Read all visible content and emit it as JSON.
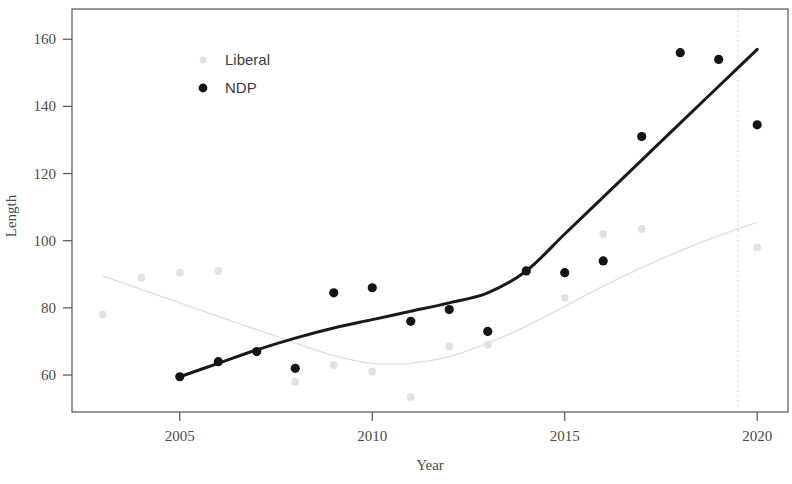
{
  "chart_data": {
    "type": "scatter",
    "title": "",
    "xlabel": "Year",
    "ylabel": "Length",
    "xlim": [
      2002.2,
      2020.8
    ],
    "ylim": [
      49,
      169
    ],
    "xticks": [
      2005,
      2010,
      2015,
      2020
    ],
    "xtick_labels": [
      "2005",
      "2010",
      "2015",
      "2020"
    ],
    "yticks": [
      60,
      80,
      100,
      120,
      140,
      160
    ],
    "ytick_labels": [
      "60",
      "80",
      "100",
      "120",
      "140",
      "160"
    ],
    "grid": false,
    "legend_position": "top-left-inside",
    "series": [
      {
        "name": "Liberal",
        "color": "#d9d9d9",
        "marker": "circle",
        "has_trend_line": true,
        "trend_line_style": "smooth-loess",
        "x": [
          2003,
          2004,
          2005,
          2006,
          2008,
          2009,
          2010,
          2011,
          2012,
          2013,
          2015,
          2016,
          2017,
          2020
        ],
        "y": [
          78,
          89,
          90.5,
          91,
          58,
          63,
          61,
          53.5,
          68.5,
          69,
          83,
          102,
          103.5,
          98
        ],
        "trend_x": [
          2003,
          2004,
          2005,
          2006,
          2007,
          2008,
          2009,
          2010,
          2011,
          2012,
          2013,
          2014,
          2015,
          2016,
          2017,
          2018,
          2019,
          2020
        ],
        "trend_y": [
          89.5,
          85.5,
          81.5,
          77.5,
          73.5,
          69.5,
          65.8,
          63.5,
          63.5,
          65.5,
          69.5,
          74.5,
          80.5,
          86.5,
          92.0,
          97.0,
          101.5,
          105.5
        ]
      },
      {
        "name": "NDP",
        "color": "#1a1a1a",
        "marker": "circle",
        "has_trend_line": true,
        "trend_line_style": "smooth-loess",
        "x": [
          2005,
          2006,
          2007,
          2008,
          2009,
          2010,
          2011,
          2012,
          2013,
          2014,
          2015,
          2016,
          2017,
          2018,
          2019,
          2020
        ],
        "y": [
          59.5,
          64,
          67,
          62,
          84.5,
          86,
          76,
          79.5,
          73,
          91,
          90.5,
          94,
          131,
          156,
          154,
          134.5
        ],
        "trend_x": [
          2005,
          2006,
          2007,
          2008,
          2009,
          2010,
          2011,
          2012,
          2013,
          2014,
          2015,
          2016,
          2017,
          2018,
          2019,
          2020
        ],
        "trend_y": [
          59.5,
          63.5,
          67.5,
          71.0,
          74.0,
          76.5,
          79.0,
          81.5,
          84.5,
          91.0,
          102.0,
          113.0,
          124.0,
          135.0,
          146.0,
          157.0
        ]
      }
    ],
    "annotations": [
      {
        "type": "vertical-line",
        "x": 2019.5,
        "style": "dotted",
        "color": "#dcdcdc"
      }
    ]
  },
  "legend": {
    "entries": [
      {
        "label": "Liberal",
        "color": "#d9d9d9"
      },
      {
        "label": "NDP",
        "color": "#1a1a1a"
      }
    ]
  },
  "axes": {
    "x_title": "Year",
    "y_title": "Length"
  }
}
